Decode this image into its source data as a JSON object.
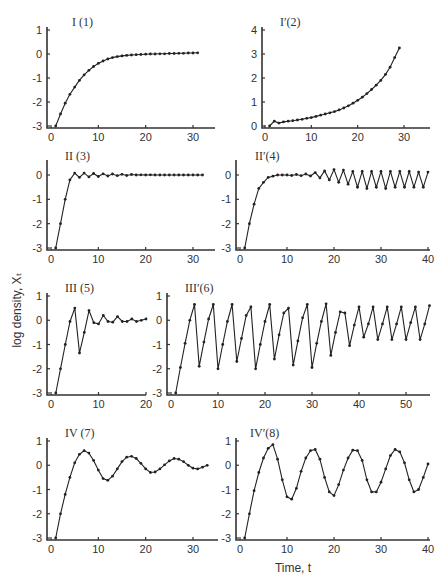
{
  "figure": {
    "ylabel": "log density, Xₜ",
    "xlabel": "Time, t"
  },
  "chart_data": [
    {
      "type": "line",
      "title": "I (1)",
      "xlim": [
        0,
        35
      ],
      "ylim": [
        -3,
        1
      ],
      "xticks": [
        0,
        10,
        20,
        30
      ],
      "yticks": [
        1,
        0,
        -1,
        -2,
        -3
      ],
      "x": [
        1,
        2,
        3,
        4,
        5,
        6,
        7,
        8,
        9,
        10,
        11,
        12,
        13,
        14,
        15,
        16,
        17,
        18,
        19,
        20,
        21,
        22,
        23,
        24,
        25,
        26,
        27,
        28,
        29,
        30,
        31
      ],
      "values": [
        -3.0,
        -2.5,
        -2.05,
        -1.68,
        -1.38,
        -1.1,
        -0.87,
        -0.68,
        -0.52,
        -0.39,
        -0.29,
        -0.21,
        -0.15,
        -0.11,
        -0.08,
        -0.06,
        -0.04,
        -0.03,
        -0.02,
        -0.01,
        0.0,
        0.0,
        0.01,
        0.01,
        0.02,
        0.02,
        0.03,
        0.03,
        0.04,
        0.04,
        0.05
      ]
    },
    {
      "type": "line",
      "title": "I′(2)",
      "xlim": [
        0,
        35
      ],
      "ylim": [
        0,
        4
      ],
      "xticks": [
        0,
        10,
        20,
        30
      ],
      "yticks": [
        4,
        3,
        2,
        1,
        0
      ],
      "x": [
        1,
        2,
        3,
        4,
        5,
        6,
        7,
        8,
        9,
        10,
        11,
        12,
        13,
        14,
        15,
        16,
        17,
        18,
        19,
        20,
        21,
        22,
        23,
        24,
        25,
        26,
        27,
        28,
        29
      ],
      "values": [
        0.0,
        0.2,
        0.12,
        0.17,
        0.2,
        0.22,
        0.25,
        0.28,
        0.32,
        0.35,
        0.4,
        0.45,
        0.5,
        0.55,
        0.6,
        0.67,
        0.75,
        0.84,
        0.95,
        1.07,
        1.2,
        1.35,
        1.52,
        1.7,
        1.9,
        2.15,
        2.45,
        2.85,
        3.25
      ]
    },
    {
      "type": "line",
      "title": "II (3)",
      "xlim": [
        0,
        35
      ],
      "ylim": [
        -3,
        0.5
      ],
      "xticks": [
        0,
        10,
        20,
        30
      ],
      "yticks": [
        0,
        -1,
        -2,
        -3
      ],
      "x": [
        1,
        2,
        3,
        4,
        5,
        6,
        7,
        8,
        9,
        10,
        11,
        12,
        13,
        14,
        15,
        16,
        17,
        18,
        19,
        20,
        21,
        22,
        23,
        24,
        25,
        26,
        27,
        28,
        29,
        30,
        31,
        32
      ],
      "values": [
        -3.0,
        -2.0,
        -1.0,
        -0.2,
        0.08,
        -0.1,
        0.08,
        -0.08,
        0.06,
        -0.06,
        0.05,
        -0.04,
        0.04,
        -0.03,
        0.03,
        -0.02,
        0.02,
        0.0,
        0.01,
        0.0,
        0.01,
        0.0,
        0.0,
        0.0,
        0.0,
        0.0,
        0.0,
        0.0,
        0.0,
        0.0,
        0.0,
        0.0
      ]
    },
    {
      "type": "line",
      "title": "II′(4)",
      "xlim": [
        0,
        40
      ],
      "ylim": [
        -3,
        0.5
      ],
      "xticks": [
        0,
        10,
        20,
        30,
        40
      ],
      "yticks": [
        0,
        -1,
        -2,
        -3
      ],
      "x": [
        1,
        2,
        3,
        4,
        5,
        6,
        7,
        8,
        9,
        10,
        11,
        12,
        13,
        14,
        15,
        16,
        17,
        18,
        19,
        20,
        21,
        22,
        23,
        24,
        25,
        26,
        27,
        28,
        29,
        30,
        31,
        32,
        33,
        34,
        35,
        36,
        37,
        38,
        39,
        40
      ],
      "values": [
        -3.0,
        -2.0,
        -1.2,
        -0.55,
        -0.3,
        -0.1,
        -0.05,
        0.0,
        0.0,
        0.0,
        -0.02,
        0.02,
        -0.03,
        0.04,
        -0.04,
        0.1,
        -0.12,
        0.17,
        -0.2,
        0.22,
        -0.3,
        0.2,
        -0.38,
        0.15,
        -0.5,
        0.15,
        -0.55,
        0.15,
        -0.5,
        0.15,
        -0.55,
        0.15,
        -0.5,
        0.15,
        -0.5,
        0.15,
        -0.5,
        0.12,
        -0.5,
        0.12
      ]
    },
    {
      "type": "line",
      "title": "III (5)",
      "xlim": [
        0,
        20
      ],
      "ylim": [
        -3,
        1
      ],
      "xticks": [
        0,
        10,
        20
      ],
      "yticks": [
        1,
        0,
        -1,
        -2,
        -3
      ],
      "x": [
        1,
        2,
        3,
        4,
        5,
        6,
        7,
        8,
        9,
        10,
        11,
        12,
        13,
        14,
        15,
        16,
        17,
        18,
        19,
        20
      ],
      "values": [
        -3.0,
        -2.0,
        -1.0,
        -0.05,
        0.5,
        -1.35,
        -0.5,
        0.4,
        -0.1,
        -0.15,
        0.2,
        -0.05,
        -0.08,
        0.15,
        -0.05,
        -0.05,
        0.05,
        -0.05,
        0.0,
        0.05
      ]
    },
    {
      "type": "line",
      "title": "III′(6)",
      "xlim": [
        0,
        55
      ],
      "ylim": [
        -3,
        1
      ],
      "xticks": [
        0,
        10,
        20,
        30,
        40,
        50
      ],
      "yticks": [
        1,
        0,
        -1,
        -2,
        -3
      ],
      "x": [
        1,
        2,
        3,
        4,
        5,
        6,
        7,
        8,
        9,
        10,
        11,
        12,
        13,
        14,
        15,
        16,
        17,
        18,
        19,
        20,
        21,
        22,
        23,
        24,
        25,
        26,
        27,
        28,
        29,
        30,
        31,
        32,
        33,
        34,
        35,
        36,
        37,
        38,
        39,
        40,
        41,
        42,
        43,
        44,
        45,
        46,
        47,
        48,
        49,
        50,
        51,
        52,
        53,
        54,
        55
      ],
      "values": [
        -3.0,
        -1.95,
        -0.95,
        0.0,
        0.65,
        -1.9,
        -0.9,
        0.05,
        0.65,
        -2.0,
        -1.0,
        -0.05,
        0.65,
        -1.7,
        -0.75,
        0.2,
        0.55,
        -2.0,
        -1.0,
        -0.05,
        0.65,
        -1.6,
        -0.6,
        0.3,
        0.5,
        -1.85,
        -0.85,
        0.1,
        0.65,
        -1.95,
        -0.95,
        -0.05,
        0.68,
        -1.45,
        -0.5,
        0.35,
        0.3,
        -1.05,
        -0.2,
        0.55,
        -0.7,
        -0.15,
        0.55,
        -0.8,
        -0.15,
        0.55,
        -0.8,
        -0.15,
        0.55,
        -0.8,
        -0.1,
        0.55,
        -0.8,
        -0.15,
        0.6
      ]
    },
    {
      "type": "line",
      "title": "IV (7)",
      "xlim": [
        0,
        35
      ],
      "ylim": [
        -3,
        1
      ],
      "xticks": [
        0,
        10,
        20,
        30
      ],
      "yticks": [
        1,
        0,
        -1,
        -2,
        -3
      ],
      "x": [
        1,
        2,
        3,
        4,
        5,
        6,
        7,
        8,
        9,
        10,
        11,
        12,
        13,
        14,
        15,
        16,
        17,
        18,
        19,
        20,
        21,
        22,
        23,
        24,
        25,
        26,
        27,
        28,
        29,
        30,
        31,
        32,
        33
      ],
      "values": [
        -3.0,
        -2.0,
        -1.2,
        -0.5,
        0.1,
        0.45,
        0.6,
        0.5,
        0.2,
        -0.2,
        -0.55,
        -0.62,
        -0.45,
        -0.15,
        0.15,
        0.33,
        0.37,
        0.28,
        0.08,
        -0.15,
        -0.3,
        -0.28,
        -0.15,
        0.02,
        0.18,
        0.28,
        0.25,
        0.15,
        0.0,
        -0.12,
        -0.15,
        -0.08,
        0.0
      ]
    },
    {
      "type": "line",
      "title": "IV′(8)",
      "xlim": [
        0,
        40
      ],
      "ylim": [
        -3,
        1
      ],
      "xticks": [
        0,
        10,
        20,
        30,
        40
      ],
      "yticks": [
        1,
        0,
        -1,
        -2,
        -3
      ],
      "x": [
        1,
        2,
        3,
        4,
        5,
        6,
        7,
        8,
        9,
        10,
        11,
        12,
        13,
        14,
        15,
        16,
        17,
        18,
        19,
        20,
        21,
        22,
        23,
        24,
        25,
        26,
        27,
        28,
        29,
        30,
        31,
        32,
        33,
        34,
        35,
        36,
        37,
        38,
        39,
        40
      ],
      "values": [
        -3.0,
        -2.0,
        -1.05,
        -0.3,
        0.3,
        0.7,
        0.85,
        0.25,
        -0.6,
        -1.3,
        -1.4,
        -0.95,
        -0.25,
        0.3,
        0.6,
        0.65,
        0.25,
        -0.5,
        -1.1,
        -1.25,
        -0.8,
        -0.2,
        0.3,
        0.62,
        0.6,
        0.2,
        -0.6,
        -1.1,
        -1.1,
        -0.7,
        -0.15,
        0.4,
        0.65,
        0.55,
        0.1,
        -0.6,
        -1.1,
        -1.0,
        -0.5,
        0.05
      ]
    }
  ]
}
